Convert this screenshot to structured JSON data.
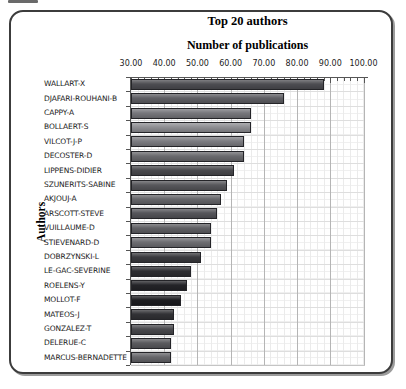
{
  "artifact_note": "small dark crop mark at top-left of screenshot",
  "chart_data": {
    "type": "bar",
    "orientation": "horizontal",
    "title": "Top 20 authors",
    "subtitle": "Number of publications",
    "ylabel": "Authors",
    "x_axis": {
      "min": 30,
      "max": 100,
      "tick_step": 10,
      "tick_labels": [
        "30.00",
        "40.00",
        "50.00",
        "60.00",
        "70.00",
        "80.00",
        "90.00",
        "100.00"
      ]
    },
    "legend": "none",
    "grid": {
      "minor_mesh": true,
      "major_color": "#b5b5b5",
      "minor_color": "#ebebeb"
    },
    "categories": [
      "WALLART-X",
      "DJAFARI-ROUHANI-B",
      "CAPPY-A",
      "BOLLAERT-S",
      "VILCOT-J-P",
      "DECOSTER-D",
      "LIPPENS-DIDIER",
      "SZUNERITS-SABINE",
      "AKJOUJ-A",
      "ARSCOTT-STEVE",
      "VUILLAUME-D",
      "STIEVENARD-D",
      "DOBRZYNSKI-L",
      "LE-GAC-SEVERINE",
      "ROELENS-Y",
      "MOLLOT-F",
      "MATEOS-J",
      "GONZALEZ-T",
      "DELERUE-C",
      "MARCUS-BERNADETTE"
    ],
    "values": [
      88,
      76,
      66,
      66,
      64,
      64,
      61,
      59,
      57,
      56,
      54,
      54,
      51,
      48,
      47,
      45,
      43,
      43,
      42,
      42
    ],
    "bar_colors": [
      "#4d4d52",
      "#5f5f64",
      "#77777c",
      "#8f8f93",
      "#7d7d82",
      "#6a6a6e",
      "#4a4a4e",
      "#57575b",
      "#66666a",
      "#55555a",
      "#606064",
      "#6e6e72",
      "#3a3a3e",
      "#2e2e32",
      "#242428",
      "#1c1c20",
      "#323236",
      "#4a4a4e",
      "#5a5a5e",
      "#66666a"
    ]
  }
}
